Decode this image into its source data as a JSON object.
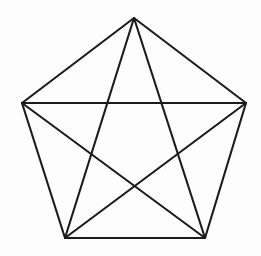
{
  "figure": {
    "title": "Regular pentagon with all diagonals (complete graph K5)",
    "canvas": {
      "width": 261,
      "height": 256,
      "background_color": "#fdfdfd"
    },
    "style": {
      "stroke_color": "#1b1b1b",
      "stroke_width": 2.1,
      "fill": "none"
    },
    "vertices": [
      {
        "id": "apex",
        "label": "top",
        "x": 134,
        "y": 18
      },
      {
        "id": "right",
        "label": "upper-right",
        "x": 246,
        "y": 103
      },
      {
        "id": "bottom-right",
        "label": "lower-right",
        "x": 205,
        "y": 238
      },
      {
        "id": "bottom-left",
        "label": "lower-left",
        "x": 65,
        "y": 238
      },
      {
        "id": "left",
        "label": "upper-left",
        "x": 22,
        "y": 103
      }
    ],
    "perimeter_edges": [
      {
        "id": "edge-apex-right",
        "from": "apex",
        "to": "right",
        "x1": 134,
        "y1": 18,
        "x2": 246,
        "y2": 103
      },
      {
        "id": "edge-right-bottomright",
        "from": "right",
        "to": "bottom-right",
        "x1": 246,
        "y1": 103,
        "x2": 205,
        "y2": 238
      },
      {
        "id": "edge-bottomright-bottomleft",
        "from": "bottom-right",
        "to": "bottom-left",
        "x1": 205,
        "y1": 238,
        "x2": 65,
        "y2": 238
      },
      {
        "id": "edge-bottomleft-left",
        "from": "bottom-left",
        "to": "left",
        "x1": 65,
        "y1": 238,
        "x2": 22,
        "y2": 103
      },
      {
        "id": "edge-left-apex",
        "from": "left",
        "to": "apex",
        "x1": 22,
        "y1": 103,
        "x2": 134,
        "y2": 18
      }
    ],
    "diagonal_edges": [
      {
        "id": "diag-left-right",
        "from": "left",
        "to": "right",
        "x1": 22,
        "y1": 103,
        "x2": 246,
        "y2": 103
      },
      {
        "id": "diag-apex-bottomleft",
        "from": "apex",
        "to": "bottom-left",
        "x1": 134,
        "y1": 18,
        "x2": 65,
        "y2": 238
      },
      {
        "id": "diag-apex-bottomright",
        "from": "apex",
        "to": "bottom-right",
        "x1": 134,
        "y1": 18,
        "x2": 205,
        "y2": 238
      },
      {
        "id": "diag-left-bottomright",
        "from": "left",
        "to": "bottom-right",
        "x1": 22,
        "y1": 103,
        "x2": 205,
        "y2": 238
      },
      {
        "id": "diag-right-bottomleft",
        "from": "right",
        "to": "bottom-left",
        "x1": 246,
        "y1": 103,
        "x2": 65,
        "y2": 238
      }
    ],
    "counts": {
      "vertices": 5,
      "perimeter_edges": 5,
      "diagonal_edges": 5,
      "total_edges": 10
    }
  }
}
